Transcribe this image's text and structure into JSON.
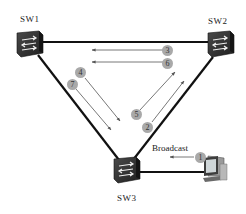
{
  "diagram": {
    "title": "",
    "nodes": [
      {
        "id": "sw1",
        "label": "SW1",
        "type": "switch"
      },
      {
        "id": "sw2",
        "label": "SW2",
        "type": "switch"
      },
      {
        "id": "sw3",
        "label": "SW3",
        "type": "switch"
      },
      {
        "id": "pc",
        "label": "",
        "type": "computer"
      }
    ],
    "links": [
      {
        "from": "sw1",
        "to": "sw2"
      },
      {
        "from": "sw1",
        "to": "sw3"
      },
      {
        "from": "sw2",
        "to": "sw3"
      },
      {
        "from": "sw3",
        "to": "pc"
      }
    ],
    "steps": [
      {
        "n": "1",
        "direction": "pc -> sw3",
        "note": "Broadcast"
      },
      {
        "n": "2",
        "direction": "sw3 -> sw2"
      },
      {
        "n": "3",
        "direction": "sw2 -> sw1"
      },
      {
        "n": "4",
        "direction": "sw1 -> sw3"
      },
      {
        "n": "5",
        "direction": "sw3 -> sw2"
      },
      {
        "n": "6",
        "direction": "sw2 -> sw1"
      },
      {
        "n": "7",
        "direction": "sw1 -> sw3"
      }
    ],
    "broadcast_label": "Broadcast",
    "colors": {
      "link": "#111111",
      "arrow": "#555555",
      "step_circle": "#a9a9a9",
      "switch_body": "#2e2e2e"
    }
  }
}
